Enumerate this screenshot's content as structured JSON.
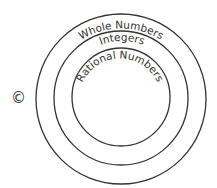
{
  "diagram": {
    "type": "nested-circles",
    "circles": [
      {
        "label": "Whole Numbers",
        "level": "outer"
      },
      {
        "label": "Integers",
        "level": "middle"
      },
      {
        "label": "Rational Numbers",
        "level": "inner"
      }
    ],
    "choice_marker": "©",
    "stroke_color": "#333333"
  }
}
